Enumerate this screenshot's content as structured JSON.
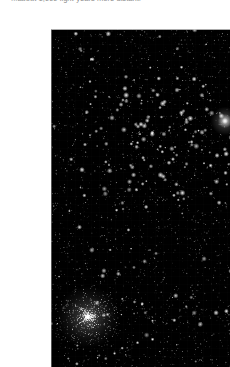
{
  "page": {
    "background_color": "#ffffff",
    "width": 230,
    "height": 367
  },
  "caption": {
    "text": "...about 1,000 light-years more distant.",
    "color": "#8d8d8d",
    "clipped_by_top_edge": true
  },
  "photo": {
    "alt_label": "Deep-sky photograph of a rich star field",
    "background_color": "#000000",
    "border_color": "#c9c9c9",
    "frame": {
      "left": 11,
      "top": 13,
      "width": 211,
      "height": 344
    },
    "star_color": "#ffffff",
    "objects": [
      {
        "name": "open-cluster",
        "label": "Open cluster",
        "type": "open",
        "center_x": 112,
        "center_y": 108,
        "radius": 62,
        "star_count": 90,
        "concentration": 0.55
      },
      {
        "name": "globular-cluster",
        "label": "Globular cluster",
        "type": "globular",
        "center_x": 37,
        "center_y": 288,
        "radius": 34,
        "star_count": 900,
        "concentration": 2.6
      },
      {
        "name": "bright-nebulous-star",
        "label": "Bright nebulous star",
        "type": "bright-star",
        "center_x": 174,
        "center_y": 92,
        "radius": 5.5,
        "star_count": 1,
        "concentration": 1.0
      }
    ],
    "field": {
      "background_star_count": 2600,
      "bright_star_count": 150,
      "seed": 20240517
    }
  }
}
